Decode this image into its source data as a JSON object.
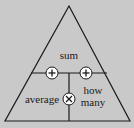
{
  "diagram": {
    "type": "formula-triangle",
    "labels": {
      "top": "sum",
      "bottom_left": "average",
      "bottom_right_line1": "how",
      "bottom_right_line2": "many"
    },
    "operators": {
      "left": "+",
      "right": "+",
      "center": "×"
    },
    "colors": {
      "background": "#c9c9c9",
      "line": "#1a1a1a",
      "operator_fill": "#ffffff"
    }
  }
}
